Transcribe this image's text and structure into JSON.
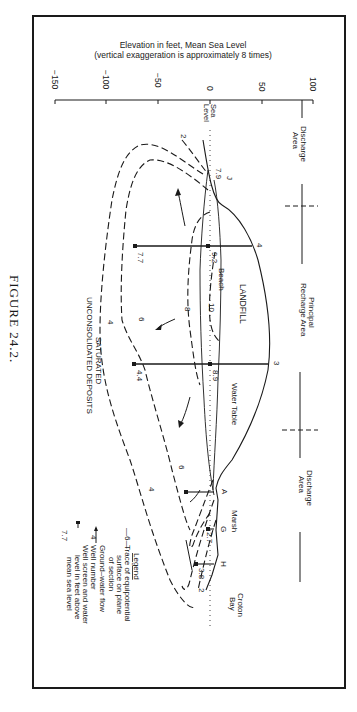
{
  "figure": {
    "caption": "FIGURE 24.2.",
    "orientation": "rotated 90 degrees clockwise"
  },
  "axis": {
    "title_line1": "Elevation in feet, Mean Sea Level",
    "title_line2": "(vertical exaggeration is approximately 8 times)",
    "ticks": [
      "−150",
      "−100",
      "−50",
      "0",
      "50",
      "100"
    ],
    "tick_values": [
      -150,
      -100,
      -50,
      0,
      50,
      100
    ],
    "sea_level_label_1": "Sea",
    "sea_level_label_2": "Level"
  },
  "zones": {
    "discharge_left_1": "Discharge",
    "discharge_left_2": "Area",
    "recharge_1": "Principal",
    "recharge_2": "Recharge Area",
    "discharge_right_1": "Discharge",
    "discharge_right_2": "Area"
  },
  "labels": {
    "landfill": "LANDFILL",
    "beach": "Beach",
    "water_table": "Water Table",
    "marsh": "Marsh",
    "croton_bay_1": "Croton",
    "croton_bay_2": "Bay",
    "saturated_1": "SATURATED",
    "saturated_2": "UNCONSOLIDATED DEPOSITS"
  },
  "wells": [
    {
      "id": "J",
      "level": "7.9"
    },
    {
      "id": "4",
      "level": "9.2",
      "deep_level": "7.7"
    },
    {
      "id": "3",
      "level": "8.9",
      "deep_level": "4.4"
    },
    {
      "id": "A"
    },
    {
      "id": "G",
      "level": "2.7"
    },
    {
      "id": "H",
      "level": "3.8"
    }
  ],
  "contours": {
    "c2_top": "2",
    "c2_bottom": "2",
    "c4_a": "4",
    "c4_b": "4",
    "c6_a": "6",
    "c6_b": "6",
    "c6_c": "6",
    "c8": "8",
    "c10": "10"
  },
  "legend": {
    "title": "Legend",
    "item1_symbol": "—6—",
    "item1_line1": "Trace of equipotential",
    "item1_line2": "surface on plane",
    "item1_line3": "of section",
    "item2_line1": "Ground–water flow",
    "item3_symbol": "4",
    "item3_line1": "Well number",
    "item4_symbol": "7.7",
    "item4_line1": "Well screen and water",
    "item4_line2": "level in feet above",
    "item4_line3": "mean sea level"
  }
}
